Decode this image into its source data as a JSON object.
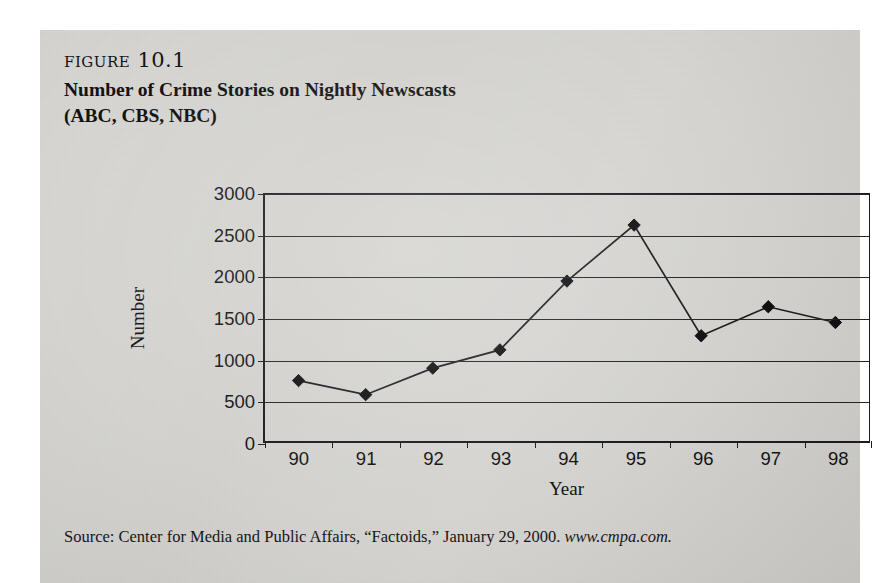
{
  "figure": {
    "label": "figure 10.1",
    "title": "Number of Crime Stories on Nightly Newscasts",
    "subtitle": "(ABC, CBS, NBC)",
    "source_text": "Source: Center for Media and Public Affairs, “Factoids,” January 29, 2000. ",
    "source_url": "www.cmpa.com."
  },
  "chart_data": {
    "type": "line",
    "title": "Number of Crime Stories on Nightly Newscasts (ABC, CBS, NBC)",
    "xlabel": "Year",
    "ylabel": "Number",
    "categories": [
      "90",
      "91",
      "92",
      "93",
      "94",
      "95",
      "96",
      "97",
      "98"
    ],
    "values": [
      750,
      580,
      900,
      1120,
      1950,
      2625,
      1290,
      1640,
      1450
    ],
    "series": [
      {
        "name": "Number of Crime Stories",
        "values": [
          750,
          580,
          900,
          1120,
          1950,
          2625,
          1290,
          1640,
          1450
        ]
      }
    ],
    "ylim": [
      0,
      3000
    ],
    "yticks": [
      0,
      500,
      1000,
      1500,
      2000,
      2500,
      3000
    ],
    "ytick_labels": [
      "0",
      "500",
      "1000",
      "1500",
      "2000",
      "2500",
      "3000"
    ],
    "grid": true,
    "legend": false,
    "marker": "diamond",
    "line_color": "#1c1b1d",
    "marker_color": "#100f11",
    "plot_background": "#d7d6d2"
  }
}
